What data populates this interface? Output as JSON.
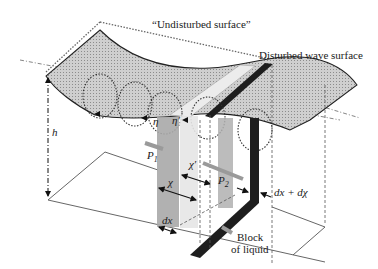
{
  "diagram": {
    "labels": {
      "undisturbed_surface": "“Undisturbed surface”",
      "disturbed_surface": "Disturbed wave surface",
      "depth": "h",
      "eta": "η",
      "eta_prime": "η′",
      "p1": "P",
      "p1_sub": "1",
      "p2": "P",
      "p2_sub": "2",
      "chi": "χ",
      "chi_prime": "χ′",
      "dx": "dx",
      "dx_dchi": "dx + dχ",
      "block_line1": "Block",
      "block_line2": "of liquid"
    },
    "colors": {
      "surface_fill": "#c8c8c8",
      "column_fill": "#a8a8a8",
      "light_column_fill": "#e4e4e4",
      "dark_band": "#1e1e1e",
      "line": "#2a2a2a",
      "arrow_gray": "#9a9a9a"
    }
  }
}
